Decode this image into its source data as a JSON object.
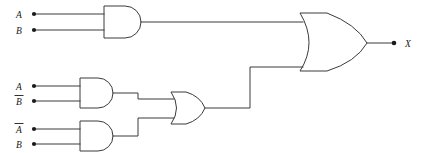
{
  "figure": {
    "expression": "X = (A AND B) OR ((A AND NOT B) OR (NOT A AND B))",
    "background_color": "#ffffff",
    "line_color": "#3a3a3a",
    "terminal_color": "#1a1a1a"
  },
  "inputs": [
    {
      "label": "A",
      "overbar": false,
      "gate": "and-gate-1",
      "pin": "top"
    },
    {
      "label": "B",
      "overbar": false,
      "gate": "and-gate-1",
      "pin": "bottom"
    },
    {
      "label": "A",
      "overbar": false,
      "gate": "and-gate-2",
      "pin": "top"
    },
    {
      "label": "B",
      "overbar": true,
      "gate": "and-gate-2",
      "pin": "bottom"
    },
    {
      "label": "A",
      "overbar": true,
      "gate": "and-gate-3",
      "pin": "top"
    },
    {
      "label": "B",
      "overbar": false,
      "gate": "and-gate-3",
      "pin": "bottom"
    }
  ],
  "gates": [
    {
      "id": "and-gate-1",
      "type": "AND",
      "inputs": [
        "A",
        "B"
      ],
      "output_to": "or-gate-output"
    },
    {
      "id": "and-gate-2",
      "type": "AND",
      "inputs": [
        "A",
        "B-bar"
      ],
      "output_to": "or-gate-mid"
    },
    {
      "id": "and-gate-3",
      "type": "AND",
      "inputs": [
        "A-bar",
        "B"
      ],
      "output_to": "or-gate-mid"
    },
    {
      "id": "or-gate-mid",
      "type": "OR",
      "inputs": [
        "and-gate-2",
        "and-gate-3"
      ],
      "output_to": "or-gate-output"
    },
    {
      "id": "or-gate-output",
      "type": "OR",
      "inputs": [
        "and-gate-1",
        "or-gate-mid"
      ],
      "output_to": "X"
    }
  ],
  "output": {
    "label": "X",
    "overbar": false
  }
}
